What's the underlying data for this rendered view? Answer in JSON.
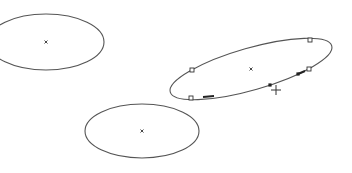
{
  "canvas": {
    "width": 352,
    "height": 173,
    "background": "#ffffff",
    "stroke_color": "#555555"
  },
  "shapes": [
    {
      "id": "ellipse-left",
      "type": "ellipse",
      "cx": 46,
      "cy": 42,
      "rx": 58,
      "ry": 28,
      "rotation": 0,
      "center_marker": {
        "x": 46,
        "y": 42,
        "glyph": "×"
      },
      "selected": false
    },
    {
      "id": "ellipse-tilted",
      "type": "ellipse",
      "cx": 251,
      "cy": 69,
      "rx": 84,
      "ry": 21,
      "rotation": -16,
      "center_marker": {
        "x": 251,
        "y": 69,
        "glyph": "×"
      },
      "selected": true,
      "handles": [
        {
          "x": 192,
          "y": 70,
          "style": "open"
        },
        {
          "x": 310,
          "y": 40,
          "style": "open"
        },
        {
          "x": 309,
          "y": 69,
          "style": "open"
        },
        {
          "x": 191,
          "y": 98,
          "style": "open"
        }
      ],
      "points": [
        {
          "x": 270,
          "y": 85,
          "style": "filled"
        },
        {
          "x": 298,
          "y": 74,
          "style": "filled"
        }
      ],
      "segments": [
        {
          "x1": 203,
          "y1": 97,
          "x2": 214,
          "y2": 96
        },
        {
          "x1": 298,
          "y1": 74,
          "x2": 305,
          "y2": 71
        }
      ]
    },
    {
      "id": "ellipse-bottom",
      "type": "ellipse",
      "cx": 142,
      "cy": 131,
      "rx": 57,
      "ry": 27,
      "rotation": 0,
      "center_marker": {
        "x": 142,
        "y": 131,
        "glyph": "×"
      },
      "selected": false
    }
  ],
  "cursor": {
    "type": "crosshair",
    "x": 276,
    "y": 90,
    "glyph": "+"
  }
}
